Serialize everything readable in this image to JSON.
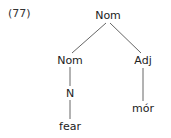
{
  "example_number": "(77)",
  "tree": {
    "root": {
      "label": "Nom",
      "x": 108,
      "y": 10
    },
    "nodes": {
      "nom_left": {
        "label": "Nom",
        "x": 70,
        "y": 55
      },
      "adj": {
        "label": "Adj",
        "x": 143,
        "y": 55
      },
      "n": {
        "label": "N",
        "x": 70,
        "y": 88
      },
      "fear": {
        "label": "fear",
        "x": 70,
        "y": 121
      },
      "mor": {
        "label": "mór",
        "x": 143,
        "y": 103
      }
    },
    "edges": [
      [
        "root",
        "nom_left"
      ],
      [
        "root",
        "adj"
      ],
      [
        "nom_left",
        "n"
      ],
      [
        "n",
        "fear"
      ],
      [
        "adj",
        "mor"
      ]
    ]
  }
}
